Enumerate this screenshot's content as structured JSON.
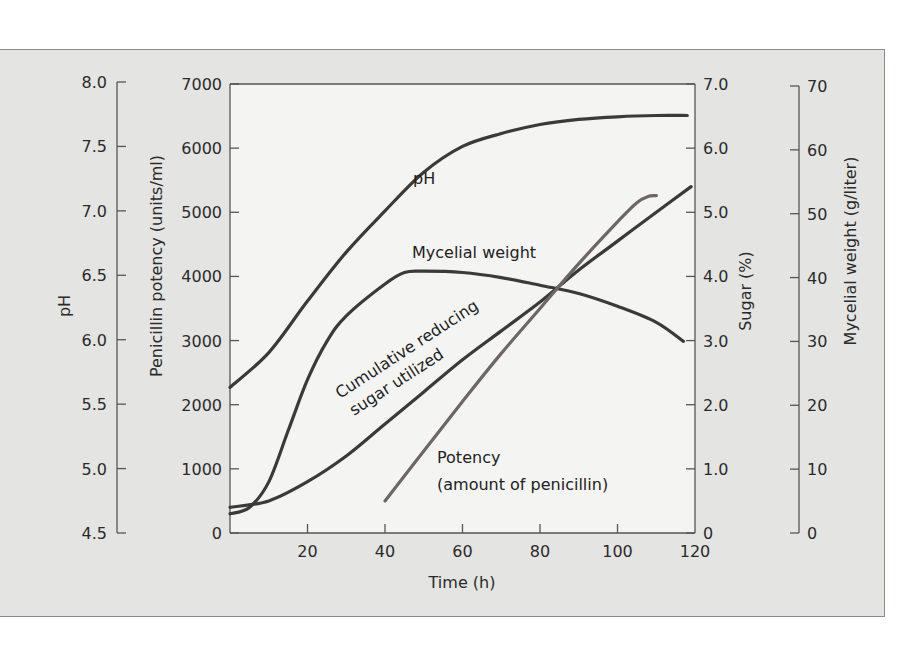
{
  "chart_data": {
    "type": "line",
    "title": "",
    "xlabel": "Time (h)",
    "xlim": [
      0,
      120
    ],
    "x_ticks": [
      "20",
      "40",
      "60",
      "80",
      "100",
      "120"
    ],
    "axes": {
      "ph": {
        "label": "pH",
        "side": "left-outer",
        "range": [
          4.5,
          8.0
        ],
        "ticks": [
          "4.5",
          "5.0",
          "5.5",
          "6.0",
          "6.5",
          "7.0",
          "7.5",
          "8.0"
        ]
      },
      "potency": {
        "label": "Penicillin potency (units/ml)",
        "side": "left-inner",
        "range": [
          0,
          7000
        ],
        "ticks": [
          "0",
          "1000",
          "2000",
          "3000",
          "4000",
          "5000",
          "6000",
          "7000"
        ]
      },
      "sugar": {
        "label": "Sugar (%)",
        "side": "right-inner",
        "range": [
          0,
          7.0
        ],
        "ticks": [
          "0",
          "1.0",
          "2.0",
          "3.0",
          "4.0",
          "5.0",
          "6.0",
          "7.0"
        ]
      },
      "mycelial": {
        "label": "Mycelial weight (g/liter)",
        "side": "right-outer",
        "range": [
          0,
          70
        ],
        "ticks": [
          "0",
          "10",
          "20",
          "30",
          "40",
          "50",
          "60",
          "70"
        ]
      }
    },
    "series": [
      {
        "name": "pH",
        "axis": "ph",
        "x": [
          0,
          10,
          20,
          30,
          40,
          50,
          60,
          70,
          80,
          90,
          100,
          110,
          118
        ],
        "values": [
          5.63,
          5.9,
          6.3,
          6.68,
          7.0,
          7.3,
          7.5,
          7.6,
          7.67,
          7.71,
          7.73,
          7.74,
          7.74
        ]
      },
      {
        "name": "Mycelial weight",
        "axis": "mycelial",
        "x": [
          0,
          5,
          10,
          15,
          20,
          25,
          30,
          40,
          45,
          50,
          60,
          70,
          80,
          90,
          100,
          110,
          117
        ],
        "values": [
          3,
          4,
          8,
          16,
          24,
          30,
          34,
          39,
          40.8,
          41,
          40.8,
          40,
          38.8,
          37.5,
          35.5,
          33,
          30
        ]
      },
      {
        "name": "Cumulative reducing sugar utilized",
        "axis": "sugar",
        "x": [
          0,
          10,
          20,
          30,
          40,
          50,
          60,
          70,
          80,
          90,
          100,
          110,
          119
        ],
        "values": [
          0.4,
          0.5,
          0.8,
          1.2,
          1.7,
          2.2,
          2.7,
          3.15,
          3.6,
          4.1,
          4.55,
          5.0,
          5.4
        ]
      },
      {
        "name": "Potency (amount of penicillin)",
        "axis": "potency",
        "x": [
          40,
          50,
          60,
          70,
          80,
          90,
          100,
          105,
          108,
          110
        ],
        "values": [
          500,
          1280,
          2050,
          2800,
          3500,
          4200,
          4850,
          5150,
          5250,
          5260
        ]
      }
    ],
    "annotations": [
      {
        "text": "pH",
        "near_series": "pH"
      },
      {
        "text": "Mycelial weight",
        "near_series": "Mycelial weight"
      },
      {
        "text": "Cumulative reducing",
        "near_series": "Cumulative reducing sugar utilized"
      },
      {
        "text": "sugar utilized",
        "near_series": "Cumulative reducing sugar utilized"
      },
      {
        "text": "Potency",
        "near_series": "Potency (amount of penicillin)"
      },
      {
        "text": "(amount of penicillin)",
        "near_series": "Potency (amount of penicillin)"
      }
    ],
    "grid": false,
    "legend": "none (inline labels)",
    "colors": {
      "curve": "#3a3a3a",
      "potency_curve": "#6e6565",
      "axis": "#555555",
      "panel_bg": "#e4e4e2",
      "plot_bg": "#f4f4f2"
    }
  }
}
